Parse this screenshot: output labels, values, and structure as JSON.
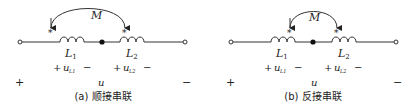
{
  "panels": [
    {
      "id": "a",
      "caption": "(a) 顺接串联",
      "mutual_label": "M",
      "inductor1": {
        "label": "L",
        "sub": "1"
      },
      "inductor2": {
        "label": "L",
        "sub": "2"
      },
      "voltage1": {
        "plus": "+",
        "label": "u",
        "sub": "L1",
        "minus": "−"
      },
      "voltage2": {
        "plus": "+",
        "label": "u",
        "sub": "L2",
        "minus": "−"
      },
      "total_voltage": {
        "plus": "+",
        "label": "u",
        "minus": "−"
      },
      "dot_marker": "*"
    },
    {
      "id": "b",
      "caption": "(b) 反接串联",
      "mutual_label": "M",
      "inductor1": {
        "label": "L",
        "sub": "1"
      },
      "inductor2": {
        "label": "L",
        "sub": "2"
      },
      "voltage1": {
        "plus": "+",
        "label": "u",
        "sub": "L1",
        "minus": "−"
      },
      "voltage2": {
        "plus": "+",
        "label": "u",
        "sub": "L2",
        "minus": "−"
      },
      "total_voltage": {
        "plus": "+",
        "label": "u",
        "minus": "−"
      },
      "dot_marker": "*"
    }
  ]
}
